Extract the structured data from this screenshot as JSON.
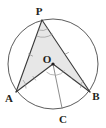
{
  "figure": {
    "background_color": "#ffffff",
    "stroke_color": "#3a3a3a",
    "circle_color": "#4a4a4a",
    "shade_color": "#d9d9d9",
    "label_color": "#231f20"
  },
  "labels": {
    "p": "P",
    "o": "O",
    "a": "A",
    "b": "B",
    "c": "C"
  },
  "geometry": {
    "circle": {
      "cx": 53,
      "cy": 64,
      "r": 45
    },
    "points": {
      "P": {
        "x": 42,
        "y": 20
      },
      "O": {
        "x": 53,
        "y": 64
      },
      "A": {
        "x": 16,
        "y": 92
      },
      "B": {
        "x": 90,
        "y": 92
      },
      "C": {
        "x": 62,
        "y": 108
      }
    },
    "segments": [
      {
        "name": "PA",
        "from": "P",
        "to": "A"
      },
      {
        "name": "PB",
        "from": "P",
        "to": "B"
      },
      {
        "name": "AO",
        "from": "A",
        "to": "O"
      },
      {
        "name": "OB",
        "from": "O",
        "to": "B"
      },
      {
        "name": "OC",
        "from": "O",
        "to": "C"
      }
    ],
    "shaded_polygon": [
      "P",
      "A",
      "O",
      "B"
    ]
  },
  "marks": {
    "angle_arc_at_p": "arc",
    "angle_arc_at_o": "arc",
    "tick_marks": "congruence-ticks"
  }
}
